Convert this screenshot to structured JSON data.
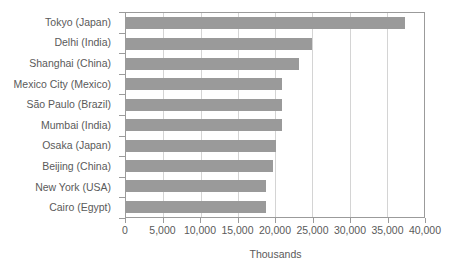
{
  "chart_data": {
    "type": "bar",
    "orientation": "horizontal",
    "title": "",
    "subtitle": "",
    "xlabel": "Thousands",
    "ylabel": "",
    "xlim": [
      0,
      40000
    ],
    "xticks": [
      0,
      5000,
      10000,
      15000,
      20000,
      25000,
      30000,
      35000,
      40000
    ],
    "xtick_labels": [
      "0",
      "5,000",
      "10,000",
      "15,000",
      "20,000",
      "25,000",
      "30,000",
      "35,000",
      "40,000"
    ],
    "grid": true,
    "grid_axis": "x",
    "legend": false,
    "legend_position": "none",
    "bar_color": "#9a9a9a",
    "axis_color": "#9b9b9b",
    "gridline_color": "#d4d4d4",
    "text_color": "#5a5a5a",
    "categories": [
      "Tokyo (Japan)",
      "Delhi (India)",
      "Shanghai (China)",
      "Mexico City (Mexico)",
      "São Paulo (Brazil)",
      "Mumbai (India)",
      "Osaka (Japan)",
      "Beijing (China)",
      "New York (USA)",
      "Cairo (Egypt)"
    ],
    "values": [
      37400,
      25000,
      23200,
      21000,
      21000,
      21000,
      20100,
      19700,
      18800,
      18800
    ],
    "series": [
      {
        "name": "Population",
        "values": [
          37400,
          25000,
          23200,
          21000,
          21000,
          21000,
          20100,
          19700,
          18800,
          18800
        ]
      }
    ]
  }
}
